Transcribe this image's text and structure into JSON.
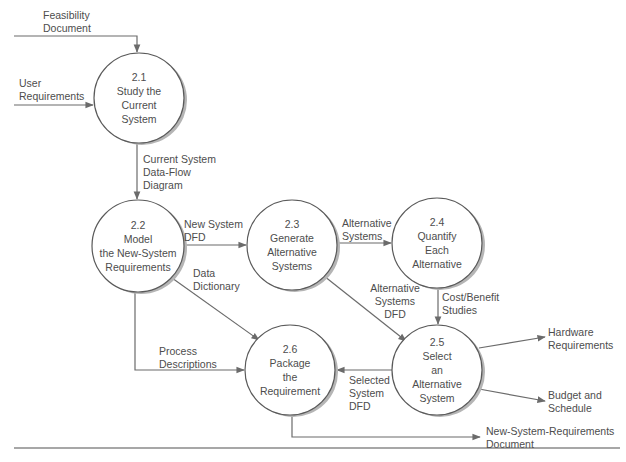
{
  "diagram": {
    "type": "data-flow-diagram",
    "colors": {
      "line": "#6b6b6b",
      "circle_stroke": "#5a5a5a",
      "shadow": "#b5b5b5",
      "text": "#4d4d4d",
      "rule": "#8a8a8a"
    },
    "processes": [
      {
        "id": "2.1",
        "lines": [
          "2.1",
          "Study the",
          "Current",
          "System"
        ],
        "cx": 139,
        "cy": 98,
        "r": 45
      },
      {
        "id": "2.2",
        "lines": [
          "2.2",
          "Model",
          "the New-System",
          "Requirements"
        ],
        "cx": 138,
        "cy": 246,
        "r": 46
      },
      {
        "id": "2.3",
        "lines": [
          "2.3",
          "Generate",
          "Alternative",
          "Systems"
        ],
        "cx": 292,
        "cy": 245,
        "r": 45
      },
      {
        "id": "2.4",
        "lines": [
          "2.4",
          "Quantify",
          "Each",
          "Alternative"
        ],
        "cx": 437,
        "cy": 243,
        "r": 45
      },
      {
        "id": "2.5",
        "lines": [
          "2.5",
          "Select",
          "an",
          "Alternative",
          "System"
        ],
        "cx": 437,
        "cy": 370,
        "r": 45
      },
      {
        "id": "2.6",
        "lines": [
          "2.6",
          "Package",
          "the",
          "Requirement"
        ],
        "cx": 290,
        "cy": 370,
        "r": 45
      }
    ],
    "flows": {
      "feasibility": [
        "Feasibility",
        "Document"
      ],
      "user_requirements": [
        "User",
        "Requirements"
      ],
      "current_system_dfd": [
        "Current System",
        "Data-Flow",
        "Diagram"
      ],
      "new_system_dfd": [
        "New System",
        "DFD"
      ],
      "data_dictionary": [
        "Data",
        "Dictionary"
      ],
      "alternative_systems": [
        "Alternative",
        "Systems"
      ],
      "alternative_systems_dfd": [
        "Alternative",
        "Systems",
        "DFD"
      ],
      "cost_benefit": [
        "Cost/Benefit",
        "Studies"
      ],
      "process_descriptions": [
        "Process",
        "Descriptions"
      ],
      "selected_system_dfd": [
        "Selected",
        "System",
        "DFD"
      ],
      "hardware_requirements": [
        "Hardware",
        "Requirements"
      ],
      "budget_schedule": [
        "Budget and",
        "Schedule"
      ],
      "new_system_requirements_doc": [
        "New-System-Requirements",
        "Document"
      ]
    }
  }
}
